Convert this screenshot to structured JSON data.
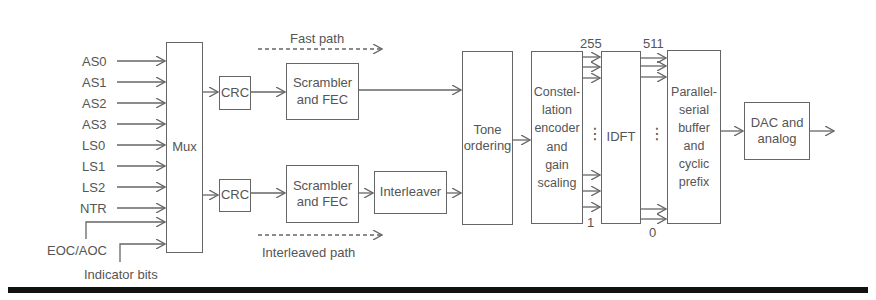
{
  "diagram": {
    "inputs": [
      "AS0",
      "AS1",
      "AS2",
      "AS3",
      "LS0",
      "LS1",
      "LS2",
      "NTR"
    ],
    "extra_inputs": {
      "eoc_label": "EOC/AOC",
      "indicator_label": "Indicator bits"
    },
    "blocks": {
      "mux": "Mux",
      "crc_fast": "CRC",
      "scrambler_fast_line1": "Scrambler",
      "scrambler_fast_line2": "and FEC",
      "crc_interleaved": "CRC",
      "scrambler_interleaved_line1": "Scrambler",
      "scrambler_interleaved_line2": "and FEC",
      "interleaver": "Interleaver",
      "tone_ordering_line1": "Tone",
      "tone_ordering_line2": "ordering",
      "constellation_lines": [
        "Constel-",
        "lation",
        "encoder",
        "and",
        "gain",
        "scaling"
      ],
      "idft": "IDFT",
      "parallel_lines": [
        "Parallel-",
        "serial",
        "buffer",
        "and",
        "cyclic",
        "prefix"
      ],
      "dac_line1": "DAC and",
      "dac_line2": "analog"
    },
    "paths": {
      "fast": "Fast path",
      "interleaved": "Interleaved path"
    },
    "indices": {
      "const_top": "255",
      "const_bottom": "1",
      "idft_top": "511",
      "idft_bottom": "0"
    },
    "ellipsis": "⋮"
  }
}
